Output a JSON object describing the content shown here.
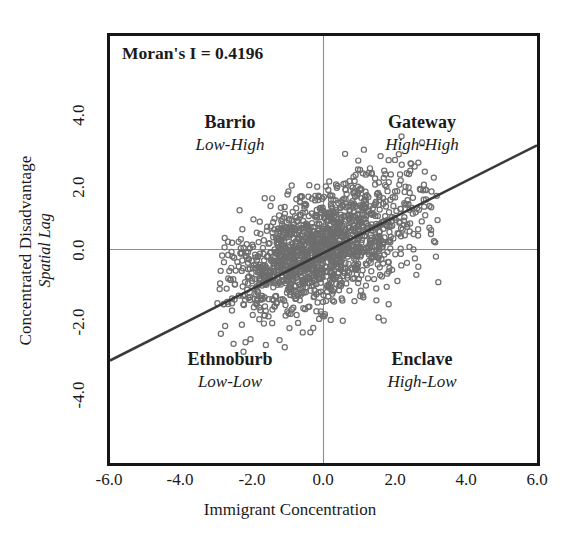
{
  "chart_data": {
    "type": "scatter",
    "title": "",
    "xlabel": "Immigrant Concentration",
    "ylabel": "Concentrated Disadvantage",
    "ylabel_sub": "Spatial Lag",
    "xlim": [
      -6.0,
      6.0
    ],
    "ylim": [
      -5.0,
      5.0
    ],
    "xticks": [
      "-6.0",
      "-4.0",
      "-2.0",
      "0.0",
      "2.0",
      "4.0",
      "6.0"
    ],
    "xtick_values": [
      -6.0,
      -4.0,
      -2.0,
      0.0,
      2.0,
      4.0,
      6.0
    ],
    "yticks": [
      "4.0",
      "2.0",
      "0.0",
      "-2.0",
      "-4.0"
    ],
    "ytick_values": [
      4.0,
      2.0,
      0.0,
      -2.0,
      -4.0
    ],
    "grid": false,
    "legend": false,
    "annotation": "Moran's I = 0.4196",
    "moran_i": 0.4196,
    "reference_lines": {
      "vertical_x": 0.0,
      "horizontal_y": 0.0,
      "color": "#8c8c8c"
    },
    "fit_line": {
      "slope": 0.4196,
      "intercept": -0.08,
      "x_start": -6.0,
      "y_start": -2.6,
      "x_end": 6.0,
      "y_end": 2.44,
      "color": "#3a3a3a"
    },
    "marker": {
      "shape": "open-circle",
      "color": "#6e6e6e",
      "radius": 2.6,
      "count": 1500
    },
    "quadrants": [
      {
        "position": "top-left",
        "name": "Barrio",
        "type": "Low-High"
      },
      {
        "position": "top-right",
        "name": "Gateway",
        "type": "High-High"
      },
      {
        "position": "bottom-left",
        "name": "Ethnoburb",
        "type": "Low-Low"
      },
      {
        "position": "bottom-right",
        "name": "Enclave",
        "type": "High-Low"
      }
    ],
    "cloud": {
      "center_x": 0.0,
      "center_y": 0.05,
      "spread_major": 1.45,
      "spread_minor": 0.62,
      "tilt_slope": 0.42,
      "x_range": [
        -3.0,
        3.3
      ],
      "y_range": [
        -2.6,
        2.9
      ]
    }
  },
  "axis": {
    "x_title": "Immigrant Concentration",
    "y_title_main": "Concentrated Disadvantage",
    "y_title_sub": "Spatial Lag"
  },
  "annotation": {
    "moran_label": "Moran's I = 0.4196"
  },
  "quadrant_labels": {
    "barrio_name": "Barrio",
    "barrio_type": "Low-High",
    "gateway_name": "Gateway",
    "gateway_type": "High-High",
    "ethnoburb_name": "Ethnoburb",
    "ethnoburb_type": "Low-Low",
    "enclave_name": "Enclave",
    "enclave_type": "High-Low"
  },
  "xticklabels": [
    "-6.0",
    "-4.0",
    "-2.0",
    "0.0",
    "2.0",
    "4.0",
    "6.0"
  ],
  "yticklabels": [
    "4.0",
    "2.0",
    "0.0",
    "-2.0",
    "-4.0"
  ],
  "colors": {
    "frame": "#161616",
    "marker": "#6e6e6e",
    "fit_line": "#3a3a3a",
    "reference_line": "#8c8c8c",
    "text": "#1a1a1a"
  }
}
